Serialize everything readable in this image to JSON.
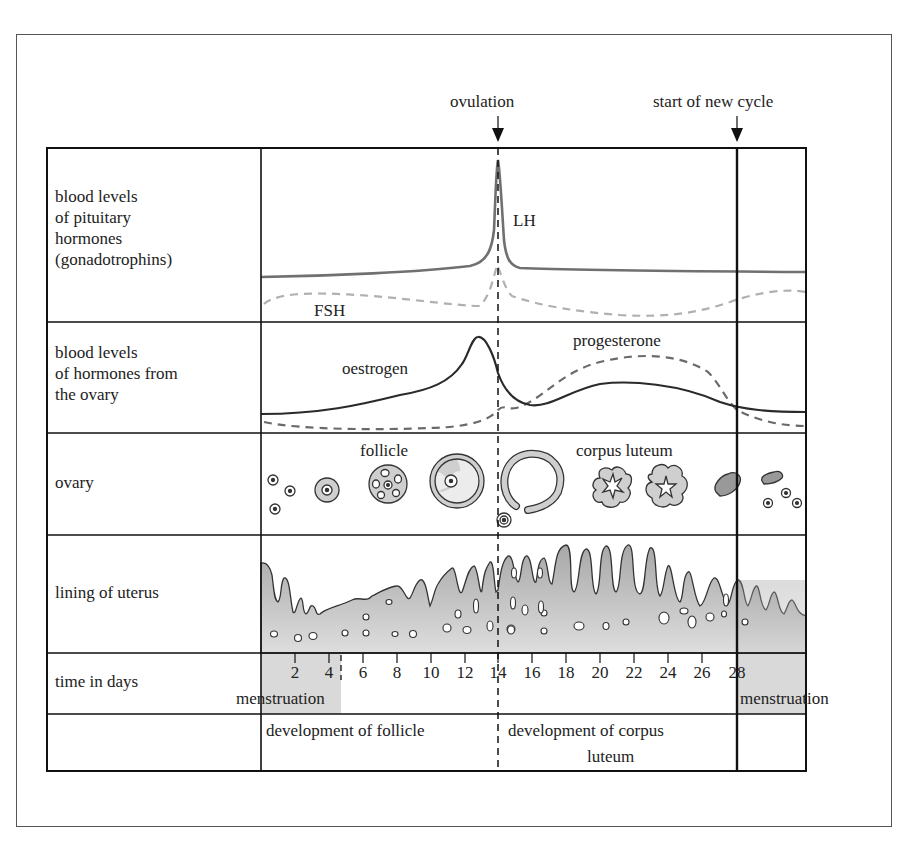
{
  "markers": {
    "ovulation": "ovulation",
    "new_cycle": "start of new cycle"
  },
  "rows": [
    {
      "label": "blood levels\nof pituitary\nhormones\n(gonadotrophins)"
    },
    {
      "label": "blood levels\nof hormones from\nthe ovary"
    },
    {
      "label": "ovary"
    },
    {
      "label": "lining of uterus"
    },
    {
      "label": "time in days"
    },
    {
      "label": ""
    }
  ],
  "row_label_lines": {
    "r0": [
      "blood levels",
      "of pituitary",
      "hormones",
      "(gonadotrophins)"
    ],
    "r1": [
      "blood levels",
      "of hormones from",
      "the ovary"
    ],
    "r2": [
      "ovary"
    ],
    "r3": [
      "lining of uterus"
    ],
    "r4": [
      "time in days"
    ]
  },
  "curve_labels": {
    "lh": "LH",
    "fsh": "FSH",
    "oestrogen": "oestrogen",
    "progesterone": "progesterone",
    "follicle": "follicle",
    "corpus_luteum": "corpus luteum"
  },
  "days": [
    "2",
    "4",
    "6",
    "8",
    "10",
    "12",
    "14",
    "16",
    "18",
    "20",
    "22",
    "24",
    "26",
    "28"
  ],
  "phases": {
    "menstruation_start": "menstruation",
    "menstruation_end": "menstruation",
    "follicle_dev": "development of follicle",
    "corpus_dev_line1": "development of corpus",
    "corpus_dev_line2": "luteum"
  },
  "colors": {
    "lh": "#707070",
    "fsh": "#b0b0b0",
    "oestrogen": "#2a2a2a",
    "progesterone": "#6a6a6a",
    "tissue": "#b8b8b8",
    "menstruation_band": "#d9d9d9"
  }
}
